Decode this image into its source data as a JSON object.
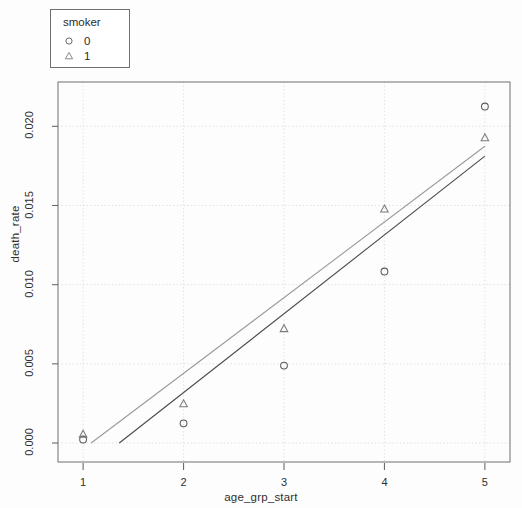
{
  "chart_data": {
    "type": "scatter",
    "title": "",
    "subtitle": "",
    "xlabel": "age_grp_start",
    "ylabel": "death_rate",
    "xlim": [
      0.75,
      5.25
    ],
    "ylim": [
      -0.0012,
      0.0228
    ],
    "grid": true,
    "grid_style": "dotted light gray at tick positions",
    "legend": {
      "title": "smoker",
      "position": "top-left outside plot",
      "entries": [
        {
          "label": "0",
          "marker": "circle"
        },
        {
          "label": "1",
          "marker": "triangle"
        }
      ]
    },
    "x_ticks": [
      1,
      2,
      3,
      4,
      5
    ],
    "x_tick_labels": [
      "1",
      "2",
      "3",
      "4",
      "5"
    ],
    "y_ticks": [
      0.0,
      0.005,
      0.01,
      0.015,
      0.02
    ],
    "y_tick_labels": [
      "0.000",
      "0.005",
      "0.010",
      "0.015",
      "0.020"
    ],
    "series": [
      {
        "name": "0",
        "marker": "circle",
        "color": "#5a5a5a",
        "x": [
          1,
          2,
          3,
          4,
          5
        ],
        "values": [
          0.00022,
          0.00124,
          0.00489,
          0.01083,
          0.02125
        ]
      },
      {
        "name": "1",
        "marker": "triangle",
        "color": "#7a7a7a",
        "x": [
          1,
          2,
          3,
          4,
          5
        ],
        "values": [
          0.00055,
          0.00247,
          0.00722,
          0.01477,
          0.01927
        ]
      }
    ],
    "fit_lines": [
      {
        "name": "0",
        "color": "#4a4a4a",
        "x_start": 1.36,
        "y_start": 0.0,
        "x_end": 5.0,
        "y_end": 0.01812
      },
      {
        "name": "1",
        "color": "#9a9a9a",
        "x_start": 1.08,
        "y_start": 0.0,
        "x_end": 5.0,
        "y_end": 0.01874
      }
    ]
  },
  "axes": {
    "x_title": "age_grp_start",
    "y_title": "death_rate"
  }
}
